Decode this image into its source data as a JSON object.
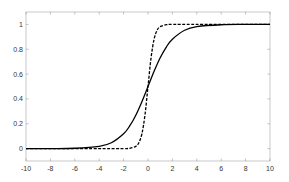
{
  "chart_data": {
    "type": "line",
    "title": "",
    "xlabel": "",
    "ylabel": "",
    "xlim": [
      -10,
      10
    ],
    "ylim": [
      -0.1,
      1.1
    ],
    "grid": false,
    "legend": null,
    "x_ticks": [
      -10,
      -8,
      -6,
      -4,
      -2,
      0,
      2,
      4,
      6,
      8,
      10
    ],
    "y_ticks": [
      0,
      0.2,
      0.4,
      0.6,
      0.8,
      1
    ],
    "x_tick_labels": [
      "-10",
      "-8",
      "-6",
      "-4",
      "-2",
      "0",
      "2",
      "4",
      "6",
      "8",
      "10"
    ],
    "y_tick_labels": [
      "0",
      "0.2",
      "0.4",
      "0.6",
      "0.8",
      "1"
    ],
    "series": [
      {
        "name": "sigmoid (solid)",
        "style": "solid",
        "color": "#000000",
        "x": [
          -10,
          -8,
          -6,
          -4,
          -3,
          -2,
          -1.5,
          -1,
          -0.5,
          0,
          0.5,
          1,
          1.5,
          2,
          3,
          4,
          6,
          8,
          10
        ],
        "y": [
          0.0,
          0.0003,
          0.0025,
          0.018,
          0.047,
          0.119,
          0.182,
          0.269,
          0.378,
          0.5,
          0.622,
          0.731,
          0.818,
          0.881,
          0.953,
          0.982,
          0.9975,
          0.9997,
          1.0
        ]
      },
      {
        "name": "steep sigmoid (dashed)",
        "style": "dashed",
        "color": "#000000",
        "x": [
          -10,
          -4,
          -2,
          -1.5,
          -1,
          -0.75,
          -0.5,
          -0.25,
          0,
          0.25,
          0.5,
          0.75,
          1,
          1.5,
          2,
          4,
          10
        ],
        "y": [
          0.0,
          0.0,
          0.0003,
          0.0025,
          0.018,
          0.047,
          0.119,
          0.269,
          0.5,
          0.731,
          0.881,
          0.953,
          0.982,
          0.9975,
          0.9997,
          1.0,
          1.0
        ]
      }
    ]
  }
}
